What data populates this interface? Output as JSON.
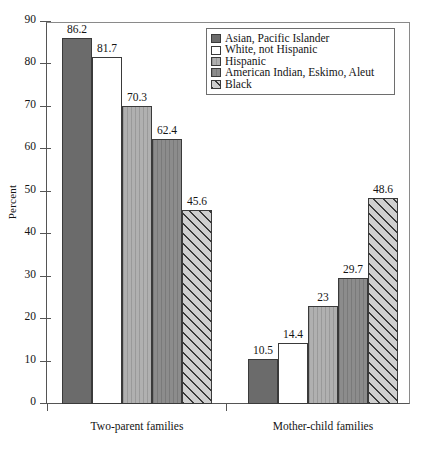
{
  "chart_data": {
    "type": "bar",
    "title": "",
    "subtitle": "",
    "xlabel": "",
    "ylabel": "Percent",
    "ylim": [
      0,
      90
    ],
    "ytick_step": 10,
    "yticks": [
      0,
      10,
      20,
      30,
      40,
      50,
      60,
      70,
      80,
      90
    ],
    "grid": false,
    "legend_position": "top-right",
    "categories": [
      "Two-parent families",
      "Mother-child families"
    ],
    "series": [
      {
        "name": "Asian, Pacific Islander",
        "values": [
          86.2,
          10.5
        ],
        "labels": [
          "86.2",
          "10.5"
        ],
        "fill": "fill-dark",
        "texture": "",
        "color": "#6b6b6b"
      },
      {
        "name": "White, not Hispanic",
        "values": [
          81.7,
          14.4
        ],
        "labels": [
          "81.7",
          "14.4"
        ],
        "fill": "fill-white",
        "texture": "",
        "color": "#ffffff"
      },
      {
        "name": "Hispanic",
        "values": [
          70.3,
          23
        ],
        "labels": [
          "70.3",
          "23"
        ],
        "fill": "fill-medium",
        "texture": "tex-vlines",
        "color": "#b0b0b0"
      },
      {
        "name": "American Indian, Eskimo, Aleut",
        "values": [
          62.4,
          29.7
        ],
        "labels": [
          "62.4",
          "29.7"
        ],
        "fill": "fill-meddark",
        "texture": "tex-vlines",
        "color": "#8c8c8c"
      },
      {
        "name": "Black",
        "values": [
          45.6,
          48.6
        ],
        "labels": [
          "45.6",
          "48.6"
        ],
        "fill": "fill-hatch",
        "texture": "",
        "color": "#cfcfcf"
      }
    ]
  },
  "axis": {
    "y_title": "Percent",
    "y_tick_labels": [
      "90",
      "80",
      "70",
      "60",
      "50",
      "40",
      "30",
      "20",
      "10",
      "0"
    ]
  },
  "legend": {
    "items": [
      {
        "label": "Asian, Pacific Islander"
      },
      {
        "label": "White, not Hispanic"
      },
      {
        "label": "Hispanic"
      },
      {
        "label": "American Indian, Eskimo, Aleut"
      },
      {
        "label": "Black"
      }
    ]
  },
  "x_groups": [
    {
      "label": "Two-parent families"
    },
    {
      "label": "Mother-child families"
    }
  ]
}
